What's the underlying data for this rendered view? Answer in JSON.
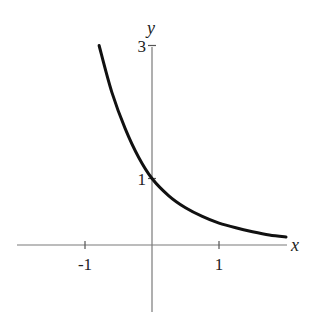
{
  "chart_data": {
    "type": "line",
    "title": "",
    "xlabel": "x",
    "ylabel": "y",
    "xlim": [
      -2.0,
      2.0
    ],
    "ylim": [
      -1.0,
      3.0
    ],
    "grid": false,
    "legend": null,
    "x_ticks": [
      {
        "value": -1,
        "label": "-1"
      },
      {
        "value": 1,
        "label": "1"
      }
    ],
    "y_ticks": [
      {
        "value": 1,
        "label": "1"
      },
      {
        "value": 3,
        "label": "3"
      }
    ],
    "series": [
      {
        "name": "decreasing exponential",
        "color": "#111111",
        "x": [
          -0.79,
          -0.6,
          -0.4,
          -0.2,
          0,
          0.25,
          0.5,
          0.75,
          1.0,
          1.25,
          1.5,
          1.75,
          2.0
        ],
        "y": [
          3.0,
          2.3,
          1.75,
          1.32,
          1.0,
          0.74,
          0.56,
          0.43,
          0.33,
          0.26,
          0.2,
          0.15,
          0.12
        ]
      }
    ]
  },
  "layout": {
    "origin_px": [
      152,
      245
    ],
    "px_per_unit_x": 67,
    "px_per_unit_y": 66.5,
    "x_axis_px": [
      17,
      287
    ],
    "y_axis_px": [
      47,
      312
    ]
  }
}
